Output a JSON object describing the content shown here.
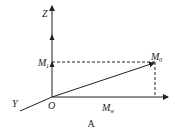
{
  "diagram": {
    "caption": "A",
    "axes": {
      "z_label": "Z",
      "y_label": "Y",
      "origin_label": "O"
    },
    "points": {
      "m1_label": "M",
      "m1_sub": "1",
      "m0_label": "M",
      "m0_sub": "0",
      "mw_label": "M",
      "mw_sub": "w"
    },
    "colors": {
      "line": "#222222"
    }
  }
}
